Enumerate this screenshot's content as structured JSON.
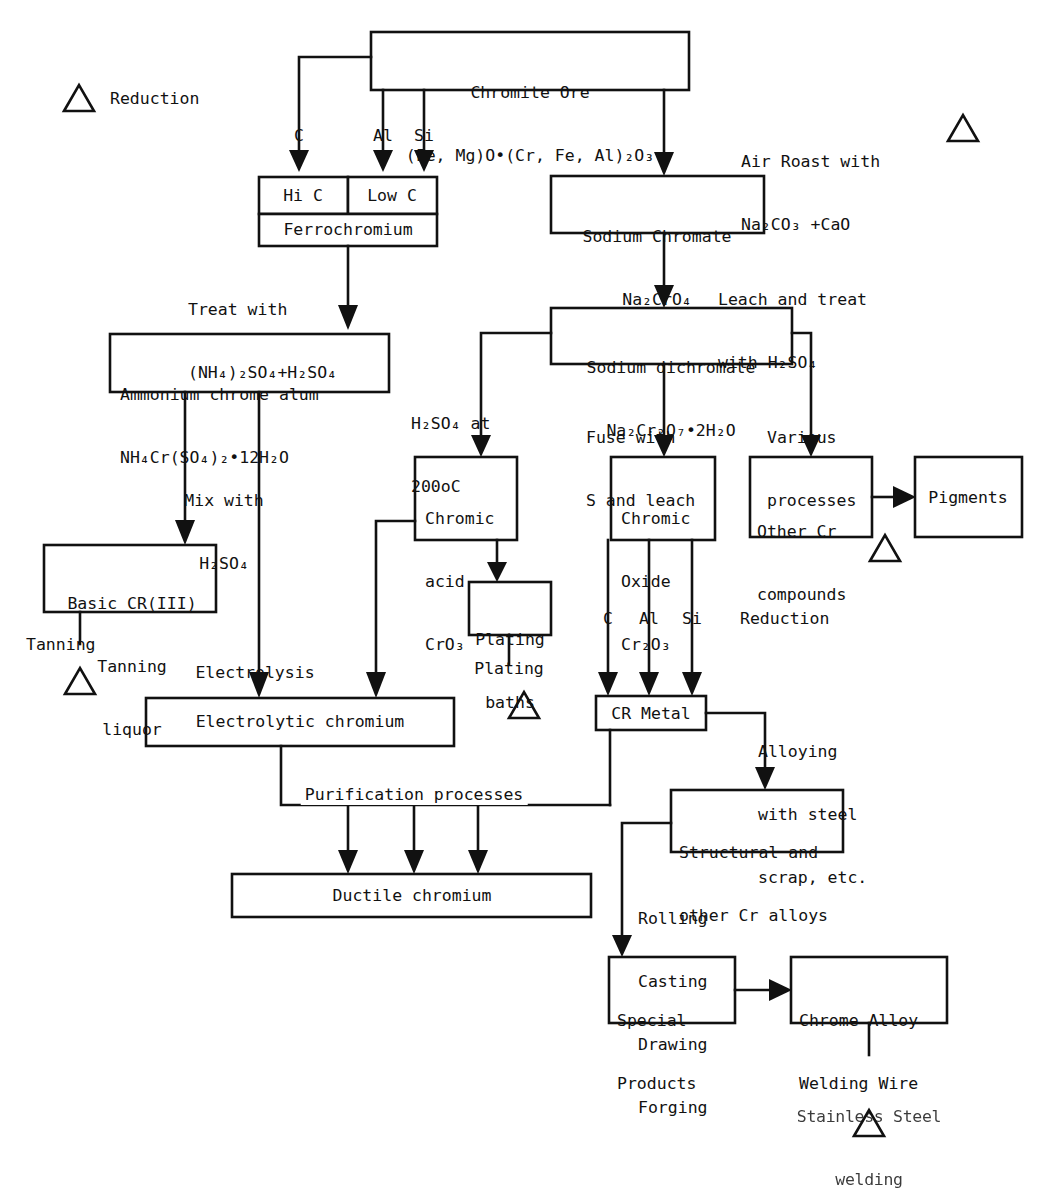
{
  "diagram": {
    "legend_symbol": "triangle",
    "line_color": "#111111",
    "box_fill": "#ffffff"
  },
  "boxes": {
    "chromite_ore": {
      "line1": "Chromite Ore",
      "line2": "(Fe, Mg)O•(Cr, Fe, Al)₂O₃"
    },
    "hi_c": {
      "label": "Hi C"
    },
    "low_c": {
      "label": "Low C"
    },
    "ferrochromium": {
      "label": "Ferrochromium"
    },
    "sodium_chromate": {
      "line1": "Sodium Chromate",
      "line2": "Na₂CrO₄"
    },
    "sodium_dichromate": {
      "line1": "Sodium dichromate",
      "line2": "Na₂Cr₂O₇•2H₂O"
    },
    "ammonium_chrome_alum": {
      "line1": "Ammonium chrome alum",
      "line2": "NH₄Cr(SO₄)₂•12H₂O"
    },
    "chromic_acid": {
      "line1": "Chromic",
      "line2": "acid",
      "line3": "CrO₃"
    },
    "chromic_oxide": {
      "line1": "Chromic",
      "line2": "Oxide",
      "line3": "Cr₂O₃"
    },
    "other_cr_compounds": {
      "line1": "Other Cr",
      "line2": "compounds"
    },
    "pigments": {
      "label": "Pigments"
    },
    "basic_cr_iii": {
      "line1": "Basic CR(III)",
      "line2": "Tanning",
      "line3": "liquor"
    },
    "plating_baths": {
      "line1": "Plating",
      "line2": "baths"
    },
    "cr_metal": {
      "label": "CR Metal"
    },
    "electrolytic_chromium": {
      "label": "Electrolytic chromium"
    },
    "ductile_chromium": {
      "label": "Ductile chromium"
    },
    "structural_alloys": {
      "line1": "Structural and",
      "line2": "other Cr alloys"
    },
    "special_products": {
      "line1": "Special",
      "line2": "Products"
    },
    "chrome_alloy_welding_wire": {
      "line1": "Chrome Alloy",
      "line2": "Welding Wire"
    }
  },
  "labels": {
    "reduction_top": "Reduction",
    "air_roast": {
      "line1": "Air Roast with",
      "line2": "Na₂CO₃ +CaO"
    },
    "reductant_c": "C",
    "reductant_al": "Al",
    "reductant_si": "Si",
    "treat_with": {
      "line1": "Treat with",
      "line2": "(NH₄)₂SO₄+H₂SO₄"
    },
    "leach_and_treat": {
      "line1": "Leach and treat",
      "line2": "with H₂SO₄"
    },
    "h2so4_at_200c": {
      "line1": "H₂SO₄ at",
      "line2": "200oC"
    },
    "fuse_with_s": {
      "line1": "Fuse with",
      "line2": "S and leach"
    },
    "various_processes": {
      "line1": "Various",
      "line2": "processes"
    },
    "mix_with": {
      "line1": "Mix with",
      "line2": "H₂SO₄"
    },
    "tanning": "Tanning",
    "electrolysis": "Electrolysis",
    "plating": "Plating",
    "reduction_metal": "Reduction",
    "metal_c": "C",
    "metal_al": "Al",
    "metal_si": "Si",
    "alloying": {
      "line1": "Alloying",
      "line2": "with steel",
      "line3": "scrap, etc."
    },
    "purification_processes": "Purification processes",
    "forming": {
      "line1": "Rolling",
      "line2": "Casting",
      "line3": "Drawing",
      "line4": "Forging"
    },
    "stainless_welding": {
      "line1": "Stainless Steel",
      "line2": "welding"
    }
  }
}
